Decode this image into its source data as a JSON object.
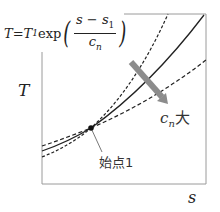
{
  "formula": {
    "lhs": "T",
    "eq": " = ",
    "coef": "T",
    "coef_sub": "1",
    "func": "exp",
    "num_a": "s",
    "num_op": " − ",
    "num_b": "s",
    "num_b_sub": "1",
    "den": "c",
    "den_sub": "n"
  },
  "axes": {
    "y_label": "T",
    "x_label": "s"
  },
  "annotations": {
    "start_point": "始点1",
    "arrow_label_var": "c",
    "arrow_label_sub": "n",
    "arrow_label_suffix": "大"
  },
  "curves": [
    {
      "name": "small-cn",
      "style": "dashed"
    },
    {
      "name": "mid-cn",
      "style": "solid"
    },
    {
      "name": "large-cn",
      "style": "dashed"
    }
  ],
  "colors": {
    "frame": "#9a9a9a",
    "curve": "#222222",
    "arrow": "#8c8c8c"
  }
}
